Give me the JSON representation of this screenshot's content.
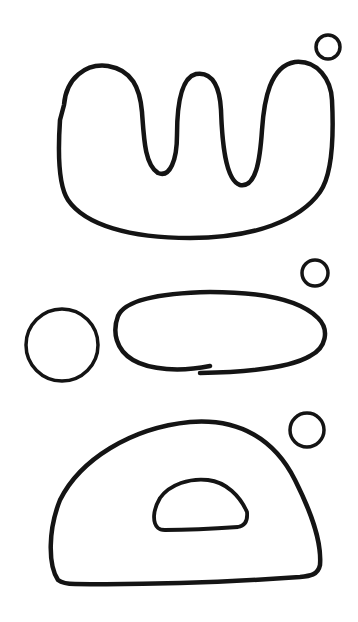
{
  "figure": {
    "background": "#ffffff",
    "ink_color": "#141414",
    "groups": [
      {
        "name": "group-top",
        "shapes": [
          {
            "kind": "wave-blob",
            "description": "large rounded U shape with two inward folds from the top"
          },
          {
            "kind": "small-circle",
            "cx": 328,
            "cy": 47,
            "r": 12
          }
        ]
      },
      {
        "name": "group-middle",
        "shapes": [
          {
            "kind": "circle",
            "cx": 62,
            "cy": 345,
            "r": 36
          },
          {
            "kind": "ellipse",
            "description": "long horizontal ellipse, open stroke at the bottom"
          },
          {
            "kind": "small-circle",
            "cx": 315,
            "cy": 273,
            "r": 13
          }
        ]
      },
      {
        "name": "group-bottom",
        "shapes": [
          {
            "kind": "dome",
            "description": "large half-dome with flat base"
          },
          {
            "kind": "inner-half-dome",
            "description": "small half-dome cutout in the middle"
          },
          {
            "kind": "small-circle",
            "cx": 307,
            "cy": 430,
            "r": 17
          }
        ]
      }
    ]
  }
}
